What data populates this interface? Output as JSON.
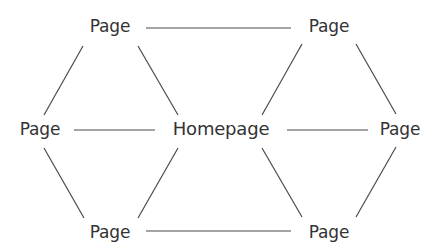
{
  "diagram": {
    "type": "hub-and-spoke site structure",
    "colors": {
      "text": "#333333",
      "edge": "#4a4a4a",
      "background": "#ffffff"
    },
    "nodes": [
      {
        "id": "top-left",
        "label": "Page",
        "x": 110,
        "y": 26
      },
      {
        "id": "top-right",
        "label": "Page",
        "x": 329,
        "y": 26
      },
      {
        "id": "left",
        "label": "Page",
        "x": 40,
        "y": 129
      },
      {
        "id": "home",
        "label": "Homepage",
        "x": 221,
        "y": 129
      },
      {
        "id": "right",
        "label": "Page",
        "x": 400,
        "y": 129
      },
      {
        "id": "bottom-left",
        "label": "Page",
        "x": 110,
        "y": 232
      },
      {
        "id": "bottom-right",
        "label": "Page",
        "x": 329,
        "y": 232
      }
    ],
    "edges": [
      {
        "from": "top-left",
        "to": "top-right",
        "x1": 146,
        "y1": 28,
        "x2": 291,
        "y2": 28
      },
      {
        "from": "top-left",
        "to": "left",
        "x1": 83,
        "y1": 46,
        "x2": 44,
        "y2": 115
      },
      {
        "from": "top-left",
        "to": "home",
        "x1": 138,
        "y1": 46,
        "x2": 178,
        "y2": 115
      },
      {
        "from": "top-right",
        "to": "home",
        "x1": 302,
        "y1": 44,
        "x2": 262,
        "y2": 115
      },
      {
        "from": "top-right",
        "to": "right",
        "x1": 356,
        "y1": 44,
        "x2": 396,
        "y2": 114
      },
      {
        "from": "left",
        "to": "home",
        "x1": 74,
        "y1": 130,
        "x2": 155,
        "y2": 130
      },
      {
        "from": "home",
        "to": "right",
        "x1": 287,
        "y1": 130,
        "x2": 368,
        "y2": 130
      },
      {
        "from": "left",
        "to": "bottom-left",
        "x1": 44,
        "y1": 148,
        "x2": 84,
        "y2": 218
      },
      {
        "from": "home",
        "to": "bottom-left",
        "x1": 178,
        "y1": 148,
        "x2": 138,
        "y2": 218
      },
      {
        "from": "home",
        "to": "bottom-right",
        "x1": 262,
        "y1": 148,
        "x2": 302,
        "y2": 217
      },
      {
        "from": "right",
        "to": "bottom-right",
        "x1": 396,
        "y1": 147,
        "x2": 356,
        "y2": 217
      },
      {
        "from": "bottom-left",
        "to": "bottom-right",
        "x1": 146,
        "y1": 231,
        "x2": 291,
        "y2": 231
      }
    ]
  }
}
